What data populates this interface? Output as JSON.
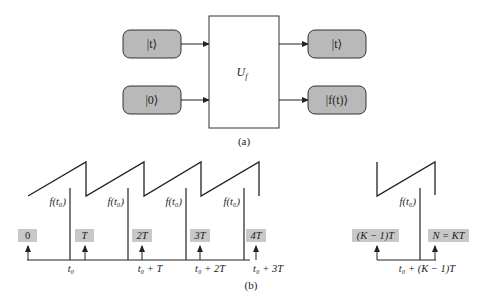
{
  "part_a": {
    "inputs": [
      "|t⟩",
      "|0⟩"
    ],
    "outputs": [
      "|t⟩",
      "|f(t)⟩"
    ],
    "gate_label": "U",
    "gate_subscript": "f",
    "caption": "(a)",
    "colors": {
      "state_box_fill": "#b9b9b9",
      "stroke": "#222222"
    }
  },
  "part_b": {
    "caption": "(b)",
    "period_labels": [
      "0",
      "T",
      "2T",
      "3T",
      "4T",
      "(K − 1)T",
      "N = KT"
    ],
    "axis_labels": [
      "t₀",
      "t₀ + T",
      "t₀ + 2T",
      "t₀ + 3T",
      "t₀ + (K − 1)T"
    ],
    "value_label": "f(t₀)",
    "colors": {
      "label_box_fill": "#c8c8c8",
      "stroke": "#222222"
    }
  }
}
